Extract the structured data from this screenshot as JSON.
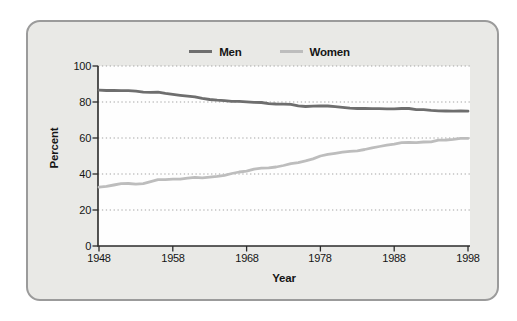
{
  "figure": {
    "card_background": "#e9e9e6",
    "card_border_color": "#9b9b9b",
    "plot_background": "#fefefe",
    "axis_color": "#2b2b2b",
    "gridline_color": "#a3a3a3",
    "text_color": "#151515"
  },
  "chart_data": {
    "type": "line",
    "title": "",
    "xlabel": "Year",
    "ylabel": "Percent",
    "xlim": [
      1948,
      1998
    ],
    "ylim": [
      0,
      100
    ],
    "x_ticks": [
      1948,
      1958,
      1968,
      1978,
      1988,
      1998
    ],
    "y_ticks": [
      0,
      20,
      40,
      60,
      80,
      100
    ],
    "grid": "horizontal-dotted",
    "legend_position": "top-center",
    "years": [
      1948,
      1949,
      1950,
      1951,
      1952,
      1953,
      1954,
      1955,
      1956,
      1957,
      1958,
      1959,
      1960,
      1961,
      1962,
      1963,
      1964,
      1965,
      1966,
      1967,
      1968,
      1969,
      1970,
      1971,
      1972,
      1973,
      1974,
      1975,
      1976,
      1977,
      1978,
      1979,
      1980,
      1981,
      1982,
      1983,
      1984,
      1985,
      1986,
      1987,
      1988,
      1989,
      1990,
      1991,
      1992,
      1993,
      1994,
      1995,
      1996,
      1997,
      1998
    ],
    "series": [
      {
        "name": "Men",
        "color": "#6e6e6e",
        "values": [
          86.6,
          86.4,
          86.4,
          86.3,
          86.3,
          86.0,
          85.5,
          85.4,
          85.5,
          84.8,
          84.2,
          83.7,
          83.3,
          82.9,
          82.0,
          81.4,
          81.0,
          80.7,
          80.4,
          80.4,
          80.1,
          79.8,
          79.7,
          79.1,
          78.9,
          78.8,
          78.7,
          77.9,
          77.5,
          77.7,
          77.9,
          77.8,
          77.4,
          77.0,
          76.6,
          76.4,
          76.4,
          76.3,
          76.3,
          76.2,
          76.2,
          76.4,
          76.4,
          75.8,
          75.8,
          75.4,
          75.1,
          75.0,
          74.9,
          75.0,
          74.9
        ]
      },
      {
        "name": "Women",
        "color": "#bdbdbd",
        "values": [
          32.7,
          33.1,
          33.9,
          34.6,
          34.7,
          34.4,
          34.6,
          35.7,
          36.9,
          36.9,
          37.1,
          37.1,
          37.7,
          38.1,
          37.9,
          38.3,
          38.7,
          39.3,
          40.3,
          41.1,
          41.6,
          42.7,
          43.3,
          43.4,
          43.9,
          44.7,
          45.7,
          46.3,
          47.3,
          48.4,
          50.0,
          50.9,
          51.5,
          52.1,
          52.6,
          52.9,
          53.6,
          54.5,
          55.3,
          56.0,
          56.6,
          57.4,
          57.5,
          57.4,
          57.8,
          57.9,
          58.8,
          58.9,
          59.3,
          59.8,
          59.8
        ]
      }
    ]
  }
}
